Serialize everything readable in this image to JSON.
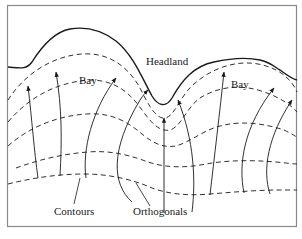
{
  "figure": {
    "type": "wave-refraction-diagram",
    "labels": {
      "headland": "Headland",
      "bay_left": "Bay",
      "bay_right": "Bay",
      "contours": "Contours",
      "orthogonals": "Orthogonals"
    },
    "colors": {
      "line": "#1a1a1a",
      "frame": "#8a8a8a",
      "background": "#ffffff"
    }
  }
}
